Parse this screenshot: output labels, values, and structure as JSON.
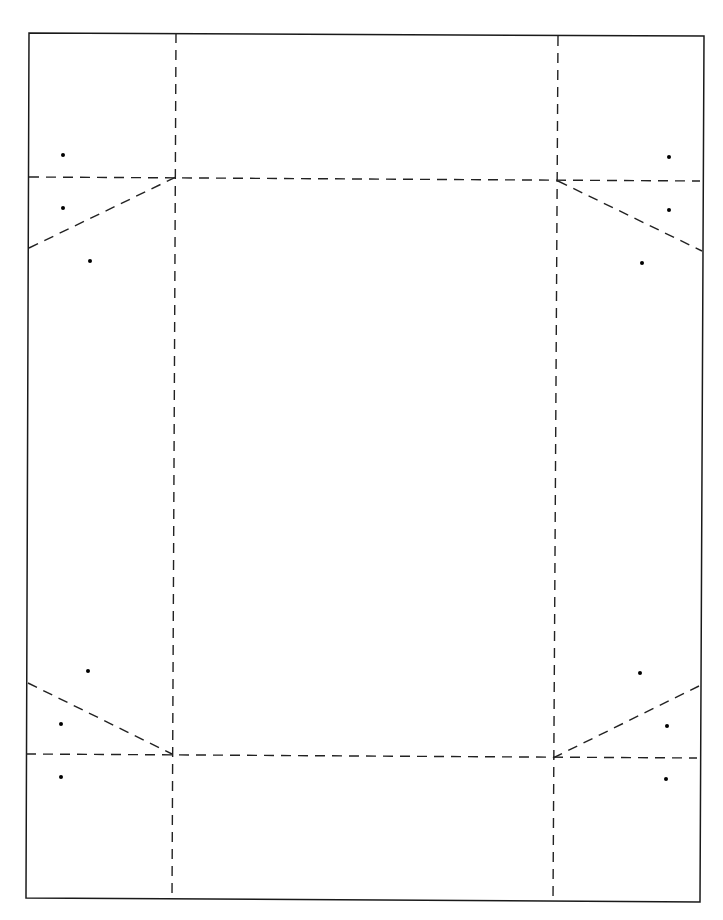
{
  "diagram": {
    "type": "fold-pattern",
    "canvas": {
      "width": 723,
      "height": 920,
      "background": "#ffffff"
    },
    "colors": {
      "outline": "#1a1a1a",
      "fold_line": "#222222",
      "dot": "#000000"
    },
    "outline": {
      "corners": [
        [
          29,
          33
        ],
        [
          704,
          36
        ],
        [
          700,
          902
        ],
        [
          26,
          898
        ]
      ],
      "style": "solid"
    },
    "fold_lines": [
      {
        "id": "left-vertical",
        "from": [
          176,
          33
        ],
        "to": [
          172,
          898
        ],
        "style": "dashed"
      },
      {
        "id": "right-vertical",
        "from": [
          558,
          36
        ],
        "to": [
          553,
          902
        ],
        "style": "dashed"
      },
      {
        "id": "top-horizontal",
        "from": [
          29,
          177
        ],
        "to": [
          700,
          181
        ],
        "style": "dashed"
      },
      {
        "id": "bottom-horizontal",
        "from": [
          26,
          754
        ],
        "to": [
          697,
          758
        ],
        "style": "dashed"
      },
      {
        "id": "top-left-diagonal",
        "from": [
          29,
          248
        ],
        "to": [
          176,
          177
        ],
        "style": "dashed"
      },
      {
        "id": "top-right-diagonal",
        "from": [
          558,
          181
        ],
        "to": [
          702,
          251
        ],
        "style": "dashed"
      },
      {
        "id": "bottom-left-diagonal",
        "from": [
          28,
          683
        ],
        "to": [
          172,
          754
        ],
        "style": "dashed"
      },
      {
        "id": "bottom-right-diagonal",
        "from": [
          553,
          758
        ],
        "to": [
          699,
          686
        ],
        "style": "dashed"
      }
    ],
    "dots": [
      {
        "corner": "top-left",
        "points": [
          [
            63,
            155
          ],
          [
            63,
            208
          ],
          [
            90,
            261
          ]
        ]
      },
      {
        "corner": "top-right",
        "points": [
          [
            669,
            157
          ],
          [
            669,
            210
          ],
          [
            642,
            263
          ]
        ]
      },
      {
        "corner": "bottom-left",
        "points": [
          [
            88,
            671
          ],
          [
            61,
            724
          ],
          [
            61,
            777
          ]
        ]
      },
      {
        "corner": "bottom-right",
        "points": [
          [
            640,
            673
          ],
          [
            667,
            726
          ],
          [
            666,
            779
          ]
        ]
      }
    ]
  }
}
